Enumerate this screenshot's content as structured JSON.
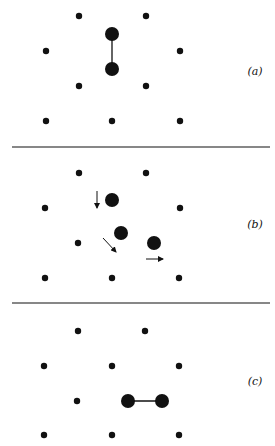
{
  "figure": {
    "colors": {
      "ink": "#111111",
      "background": "#ffffff"
    },
    "separators": [
      {
        "y": 147,
        "x1": 12,
        "x2": 270
      },
      {
        "y": 303,
        "x1": 12,
        "x2": 270
      }
    ],
    "panels": [
      {
        "id": "a",
        "label": "(a)",
        "label_pos": [
          255,
          75
        ],
        "small_atoms": [
          [
            79,
            16
          ],
          [
            146,
            16
          ],
          [
            46,
            51
          ],
          [
            180,
            51
          ],
          [
            79,
            86
          ],
          [
            146,
            86
          ],
          [
            46,
            121
          ],
          [
            112,
            121
          ],
          [
            180,
            121
          ]
        ],
        "large_atoms": [
          [
            112,
            34
          ],
          [
            112,
            69
          ]
        ],
        "bonds": [
          [
            [
              112,
              34
            ],
            [
              112,
              69
            ]
          ]
        ],
        "arrows": []
      },
      {
        "id": "b",
        "label": "(b)",
        "label_pos": [
          255,
          228
        ],
        "small_atoms": [
          [
            79,
            173
          ],
          [
            146,
            173
          ],
          [
            45,
            208
          ],
          [
            180,
            208
          ],
          [
            78,
            243
          ],
          [
            45,
            278
          ],
          [
            112,
            278
          ],
          [
            179,
            278
          ]
        ],
        "large_atoms": [
          [
            112,
            200
          ],
          [
            121,
            233
          ],
          [
            154,
            243
          ]
        ],
        "bonds": [],
        "arrows": [
          [
            [
              97,
              191
            ],
            [
              97,
              208
            ]
          ],
          [
            [
              103,
              238
            ],
            [
              116,
              252
            ]
          ],
          [
            [
              146,
              259
            ],
            [
              163,
              259
            ]
          ]
        ]
      },
      {
        "id": "c",
        "label": "(c)",
        "label_pos": [
          255,
          385
        ],
        "small_atoms": [
          [
            78,
            331
          ],
          [
            145,
            331
          ],
          [
            44,
            366
          ],
          [
            112,
            366
          ],
          [
            179,
            366
          ],
          [
            77,
            401
          ],
          [
            44,
            435
          ],
          [
            112,
            435
          ],
          [
            179,
            435
          ]
        ],
        "large_atoms": [
          [
            128,
            401
          ],
          [
            162,
            401
          ]
        ],
        "bonds": [
          [
            [
              128,
              401
            ],
            [
              162,
              401
            ]
          ]
        ],
        "arrows": []
      }
    ]
  }
}
